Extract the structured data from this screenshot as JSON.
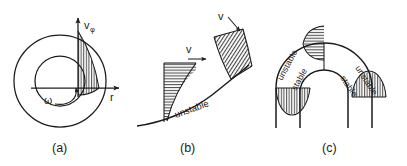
{
  "figure": {
    "background_color": "#ffffff",
    "ink_color": "#1c1c1c"
  },
  "captions": {
    "a": "(a)",
    "b": "(b)",
    "c": "(c)"
  },
  "panel_a": {
    "name": "rotating-annulus-panel",
    "axis_vertical_label": "v",
    "axis_vertical_subscript": "φ",
    "axis_horizontal_label": "r",
    "rotation_label": "ω",
    "hatch_direction": "vertical",
    "circles": [
      "outer-circle",
      "inner-circle"
    ],
    "arrows": [
      "v-phi-axis-arrow",
      "r-axis-arrow",
      "omega-rotation-arrow"
    ]
  },
  "panel_b": {
    "name": "concave-wall-boundary-layer-panel",
    "velocity_label_left": "v",
    "velocity_label_upper": "v",
    "wall_label": "unstable",
    "hatch_direction_left_profile": "horizontal",
    "hatch_direction_upper_profile": "perpendicular-to-wall",
    "arrows": [
      "v-arrow-left",
      "v-arrow-upper"
    ]
  },
  "panel_c": {
    "name": "curved-channel-panel",
    "labels": {
      "outer_left": "unstable",
      "outer_right": "unstable",
      "inner_left": "stable",
      "inner_right": "stable"
    },
    "profiles": [
      {
        "name": "top-profile",
        "hatch": "horizontal"
      },
      {
        "name": "left-leg-profile",
        "hatch": "vertical"
      },
      {
        "name": "right-leg-profile",
        "hatch": "vertical"
      }
    ]
  }
}
